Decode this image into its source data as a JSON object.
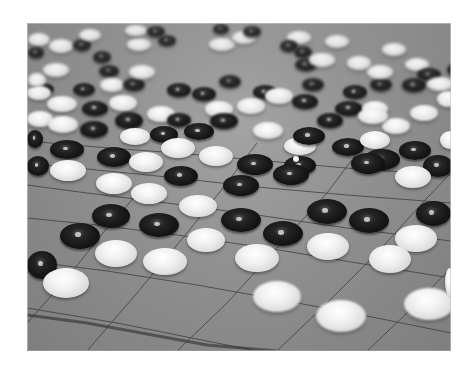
{
  "image": {
    "subject": "Go board with black and white stones",
    "tone": "grayscale photograph",
    "colors": {
      "background": "#ffffff",
      "board": "#8f8f8f",
      "black_stone": "#151515",
      "white_stone": "#f2f2f2",
      "grid_line": "#3a3a3a"
    }
  },
  "stones": [
    {
      "c": "white",
      "x": 1,
      "y": 10,
      "w": 22,
      "h": 13
    },
    {
      "c": "white",
      "x": 22,
      "y": 16,
      "w": 24,
      "h": 14
    },
    {
      "c": "black",
      "x": 46,
      "y": 16,
      "w": 18,
      "h": 12
    },
    {
      "c": "black",
      "x": 1,
      "y": 24,
      "w": 16,
      "h": 11
    },
    {
      "c": "white",
      "x": 52,
      "y": 6,
      "w": 22,
      "h": 12
    },
    {
      "c": "black",
      "x": 66,
      "y": 28,
      "w": 18,
      "h": 12
    },
    {
      "c": "black",
      "x": 72,
      "y": 42,
      "w": 20,
      "h": 12
    },
    {
      "c": "white",
      "x": 100,
      "y": 15,
      "w": 24,
      "h": 13
    },
    {
      "c": "white",
      "x": 98,
      "y": 2,
      "w": 22,
      "h": 11
    },
    {
      "c": "black",
      "x": 120,
      "y": 3,
      "w": 18,
      "h": 11
    },
    {
      "c": "black",
      "x": 131,
      "y": 12,
      "w": 18,
      "h": 11
    },
    {
      "c": "white",
      "x": 182,
      "y": 15,
      "w": 26,
      "h": 13
    },
    {
      "c": "white",
      "x": 205,
      "y": 8,
      "w": 24,
      "h": 13
    },
    {
      "c": "black",
      "x": 186,
      "y": 1,
      "w": 16,
      "h": 10
    },
    {
      "c": "black",
      "x": 216,
      "y": 3,
      "w": 18,
      "h": 11
    },
    {
      "c": "white",
      "x": 260,
      "y": 8,
      "w": 24,
      "h": 13
    },
    {
      "c": "white",
      "x": 298,
      "y": 12,
      "w": 24,
      "h": 13
    },
    {
      "c": "black",
      "x": 253,
      "y": 17,
      "w": 18,
      "h": 12
    },
    {
      "c": "black",
      "x": 267,
      "y": 23,
      "w": 18,
      "h": 12
    },
    {
      "c": "white",
      "x": 355,
      "y": 20,
      "w": 24,
      "h": 13
    },
    {
      "c": "black",
      "x": 268,
      "y": 35,
      "w": 22,
      "h": 13
    },
    {
      "c": "white",
      "x": 282,
      "y": 30,
      "w": 26,
      "h": 14
    },
    {
      "c": "white",
      "x": 320,
      "y": 33,
      "w": 24,
      "h": 14
    },
    {
      "c": "white",
      "x": 378,
      "y": 35,
      "w": 24,
      "h": 13
    },
    {
      "c": "black",
      "x": 420,
      "y": 40,
      "w": 20,
      "h": 13
    },
    {
      "c": "black",
      "x": 5,
      "y": 60,
      "w": 22,
      "h": 12
    },
    {
      "c": "white",
      "x": 16,
      "y": 40,
      "w": 26,
      "h": 14
    },
    {
      "c": "white",
      "x": 1,
      "y": 50,
      "w": 18,
      "h": 14
    },
    {
      "c": "black",
      "x": 46,
      "y": 60,
      "w": 22,
      "h": 13
    },
    {
      "c": "white",
      "x": 73,
      "y": 55,
      "w": 24,
      "h": 14
    },
    {
      "c": "black",
      "x": 96,
      "y": 55,
      "w": 22,
      "h": 13
    },
    {
      "c": "white",
      "x": 102,
      "y": 42,
      "w": 26,
      "h": 14
    },
    {
      "c": "black",
      "x": 140,
      "y": 60,
      "w": 24,
      "h": 14
    },
    {
      "c": "black",
      "x": 165,
      "y": 64,
      "w": 24,
      "h": 14
    },
    {
      "c": "black",
      "x": 192,
      "y": 52,
      "w": 22,
      "h": 13
    },
    {
      "c": "black",
      "x": 226,
      "y": 62,
      "w": 24,
      "h": 14
    },
    {
      "c": "black",
      "x": 275,
      "y": 55,
      "w": 22,
      "h": 13
    },
    {
      "c": "black",
      "x": 316,
      "y": 62,
      "w": 24,
      "h": 14
    },
    {
      "c": "black",
      "x": 343,
      "y": 55,
      "w": 22,
      "h": 13
    },
    {
      "c": "black",
      "x": 375,
      "y": 55,
      "w": 24,
      "h": 14
    },
    {
      "c": "black",
      "x": 390,
      "y": 45,
      "w": 24,
      "h": 13
    },
    {
      "c": "white",
      "x": 340,
      "y": 42,
      "w": 26,
      "h": 14
    },
    {
      "c": "white",
      "x": 400,
      "y": 54,
      "w": 26,
      "h": 14
    },
    {
      "c": "white",
      "x": 0,
      "y": 63,
      "w": 24,
      "h": 14
    },
    {
      "c": "white",
      "x": 20,
      "y": 73,
      "w": 30,
      "h": 16
    },
    {
      "c": "black",
      "x": 55,
      "y": 78,
      "w": 26,
      "h": 15
    },
    {
      "c": "white",
      "x": 82,
      "y": 72,
      "w": 28,
      "h": 16
    },
    {
      "c": "white",
      "x": 120,
      "y": 83,
      "w": 28,
      "h": 16
    },
    {
      "c": "black",
      "x": 140,
      "y": 90,
      "w": 24,
      "h": 14
    },
    {
      "c": "white",
      "x": 178,
      "y": 78,
      "w": 28,
      "h": 16
    },
    {
      "c": "white",
      "x": 210,
      "y": 75,
      "w": 28,
      "h": 16
    },
    {
      "c": "white",
      "x": 238,
      "y": 65,
      "w": 28,
      "h": 16
    },
    {
      "c": "black",
      "x": 265,
      "y": 71,
      "w": 26,
      "h": 15
    },
    {
      "c": "black",
      "x": 290,
      "y": 90,
      "w": 26,
      "h": 15
    },
    {
      "c": "black",
      "x": 308,
      "y": 78,
      "w": 28,
      "h": 15
    },
    {
      "c": "white",
      "x": 335,
      "y": 78,
      "w": 26,
      "h": 15
    },
    {
      "c": "white",
      "x": 355,
      "y": 95,
      "w": 28,
      "h": 16
    },
    {
      "c": "white",
      "x": 383,
      "y": 82,
      "w": 28,
      "h": 16
    },
    {
      "c": "white",
      "x": 410,
      "y": 68,
      "w": 22,
      "h": 16
    },
    {
      "c": "white",
      "x": 0,
      "y": 88,
      "w": 26,
      "h": 16
    },
    {
      "c": "white",
      "x": 21,
      "y": 93,
      "w": 30,
      "h": 17
    },
    {
      "c": "black",
      "x": 53,
      "y": 98,
      "w": 28,
      "h": 17
    },
    {
      "c": "black",
      "x": 88,
      "y": 89,
      "w": 28,
      "h": 17
    },
    {
      "c": "white",
      "x": 93,
      "y": 105,
      "w": 30,
      "h": 17
    },
    {
      "c": "black",
      "x": 123,
      "y": 103,
      "w": 28,
      "h": 17
    },
    {
      "c": "black",
      "x": 157,
      "y": 100,
      "w": 30,
      "h": 17
    },
    {
      "c": "black",
      "x": 183,
      "y": 90,
      "w": 28,
      "h": 16
    },
    {
      "c": "white",
      "x": 226,
      "y": 99,
      "w": 30,
      "h": 17
    },
    {
      "c": "white",
      "x": 257,
      "y": 114,
      "w": 32,
      "h": 18
    },
    {
      "c": "black",
      "x": 257,
      "y": 133,
      "w": 32,
      "h": 19
    },
    {
      "c": "black",
      "x": 266,
      "y": 104,
      "w": 32,
      "h": 18
    },
    {
      "c": "black",
      "x": 305,
      "y": 115,
      "w": 32,
      "h": 18
    },
    {
      "c": "white",
      "x": 333,
      "y": 108,
      "w": 30,
      "h": 18
    },
    {
      "c": "white",
      "x": 331,
      "y": 85,
      "w": 30,
      "h": 16
    },
    {
      "c": "black",
      "x": 372,
      "y": 118,
      "w": 32,
      "h": 19
    },
    {
      "c": "white",
      "x": 413,
      "y": 108,
      "w": 20,
      "h": 18
    },
    {
      "c": "black",
      "x": 0,
      "y": 107,
      "w": 16,
      "h": 18
    },
    {
      "c": "black",
      "x": 23,
      "y": 117,
      "w": 34,
      "h": 19
    },
    {
      "c": "black",
      "x": 0,
      "y": 133,
      "w": 22,
      "h": 20
    },
    {
      "c": "white",
      "x": 23,
      "y": 137,
      "w": 36,
      "h": 21
    },
    {
      "c": "black",
      "x": 70,
      "y": 124,
      "w": 34,
      "h": 20
    },
    {
      "c": "white",
      "x": 102,
      "y": 129,
      "w": 34,
      "h": 20
    },
    {
      "c": "white",
      "x": 134,
      "y": 115,
      "w": 34,
      "h": 20
    },
    {
      "c": "black",
      "x": 137,
      "y": 143,
      "w": 34,
      "h": 20
    },
    {
      "c": "white",
      "x": 172,
      "y": 123,
      "w": 34,
      "h": 20
    },
    {
      "c": "black",
      "x": 196,
      "y": 152,
      "w": 36,
      "h": 21
    },
    {
      "c": "black",
      "x": 210,
      "y": 131,
      "w": 36,
      "h": 21
    },
    {
      "c": "black",
      "x": 246,
      "y": 141,
      "w": 36,
      "h": 21
    },
    {
      "c": "white",
      "x": 266,
      "y": 133,
      "w": 6,
      "h": 6
    },
    {
      "c": "black",
      "x": 337,
      "y": 126,
      "w": 36,
      "h": 21
    },
    {
      "c": "black",
      "x": 324,
      "y": 132,
      "w": 0,
      "h": 0
    },
    {
      "c": "black",
      "x": 396,
      "y": 132,
      "w": 30,
      "h": 22
    },
    {
      "c": "white",
      "x": 368,
      "y": 143,
      "w": 36,
      "h": 22
    },
    {
      "c": "black",
      "x": 324,
      "y": 130,
      "w": 34,
      "h": 21
    },
    {
      "c": "white",
      "x": 69,
      "y": 150,
      "w": 36,
      "h": 21
    },
    {
      "c": "white",
      "x": 104,
      "y": 160,
      "w": 36,
      "h": 21
    },
    {
      "c": "white",
      "x": 152,
      "y": 172,
      "w": 38,
      "h": 22
    },
    {
      "c": "black",
      "x": 65,
      "y": 181,
      "w": 38,
      "h": 24
    },
    {
      "c": "black",
      "x": 112,
      "y": 190,
      "w": 40,
      "h": 24
    },
    {
      "c": "black",
      "x": 194,
      "y": 185,
      "w": 40,
      "h": 24
    },
    {
      "c": "black",
      "x": 236,
      "y": 198,
      "w": 40,
      "h": 25
    },
    {
      "c": "black",
      "x": 280,
      "y": 176,
      "w": 40,
      "h": 25
    },
    {
      "c": "black",
      "x": 322,
      "y": 185,
      "w": 40,
      "h": 25
    },
    {
      "c": "black",
      "x": 389,
      "y": 178,
      "w": 35,
      "h": 25
    },
    {
      "c": "black",
      "x": 33,
      "y": 200,
      "w": 40,
      "h": 26
    },
    {
      "c": "white",
      "x": 160,
      "y": 205,
      "w": 38,
      "h": 24
    },
    {
      "c": "white",
      "x": 68,
      "y": 217,
      "w": 42,
      "h": 27
    },
    {
      "c": "white",
      "x": 116,
      "y": 225,
      "w": 44,
      "h": 27
    },
    {
      "c": "white",
      "x": 208,
      "y": 221,
      "w": 44,
      "h": 28
    },
    {
      "c": "white",
      "x": 280,
      "y": 210,
      "w": 42,
      "h": 27
    },
    {
      "c": "white",
      "x": 368,
      "y": 202,
      "w": 42,
      "h": 27
    },
    {
      "c": "white",
      "x": 342,
      "y": 222,
      "w": 42,
      "h": 28
    },
    {
      "c": "white",
      "x": 418,
      "y": 245,
      "w": 10,
      "h": 28
    },
    {
      "c": "black",
      "x": 0,
      "y": 228,
      "w": 30,
      "h": 28
    },
    {
      "c": "white",
      "x": 16,
      "y": 245,
      "w": 46,
      "h": 30
    },
    {
      "c": "white",
      "x": 226,
      "y": 258,
      "w": 48,
      "h": 31
    },
    {
      "c": "white",
      "x": 289,
      "y": 277,
      "w": 50,
      "h": 32
    },
    {
      "c": "white",
      "x": 377,
      "y": 265,
      "w": 50,
      "h": 32
    }
  ]
}
